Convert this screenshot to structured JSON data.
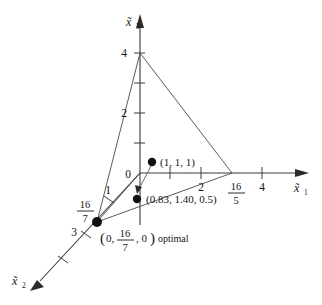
{
  "figure": {
    "type": "3d-coordinate-diagram",
    "axes": {
      "x1": {
        "label_base": "x",
        "label_sub": "1",
        "label_text": "x̃1",
        "ticks": [
          "1",
          "2",
          "4"
        ],
        "named_point": {
          "numerator": "16",
          "denominator": "5"
        }
      },
      "x2": {
        "label_base": "x",
        "label_sub": "2",
        "label_text": "x̃2",
        "ticks": [
          "1",
          "3"
        ],
        "named_point": {
          "numerator": "16",
          "denominator": "7"
        }
      },
      "x3": {
        "label_base": "x",
        "label_sub": "3",
        "label_text": "x̃3",
        "ticks": [
          "2",
          "4"
        ]
      },
      "origin_label": "0"
    },
    "points": [
      {
        "id": "start-point",
        "label": "(1, 1, 1)",
        "x": 152,
        "y": 162
      },
      {
        "id": "iterate-point",
        "label": "(0.83, 1.40, 0.5)",
        "x": 137,
        "y": 199
      },
      {
        "id": "optimal-vertex",
        "label_prefix": "(0,",
        "label_frac_num": "16",
        "label_frac_den": "7",
        "label_suffix": ", 0)",
        "label_note": "optimal",
        "x": 97,
        "y": 222
      }
    ],
    "colors": {
      "axis": "#3a3a3a",
      "edge": "#4a4a4a",
      "dot": "#111111",
      "text": "#151515",
      "background": "#ffffff"
    }
  }
}
